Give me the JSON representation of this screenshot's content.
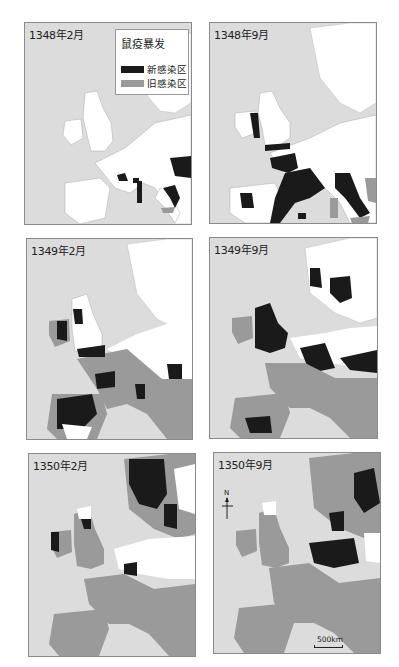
{
  "figure": {
    "type": "plague-spread-map-series",
    "panels": [
      {
        "id": "p1",
        "title": "1348年2月",
        "box": [
          24,
          22,
          166,
          201
        ]
      },
      {
        "id": "p2",
        "title": "1348年9月",
        "box": [
          209,
          22,
          166,
          200
        ]
      },
      {
        "id": "p3",
        "title": "1349年2月",
        "box": [
          26,
          238,
          165,
          200
        ]
      },
      {
        "id": "p4",
        "title": "1349年9月",
        "box": [
          209,
          237,
          167,
          200
        ]
      },
      {
        "id": "p5",
        "title": "1350年2月",
        "box": [
          28,
          453,
          166,
          202
        ]
      },
      {
        "id": "p6",
        "title": "1350年9月",
        "box": [
          213,
          452,
          166,
          200
        ]
      }
    ],
    "legend": {
      "title": "鼠疫暴发",
      "items": [
        {
          "label": "新感染区",
          "color": "#1a1a1a"
        },
        {
          "label": "旧感染区",
          "color": "#9a9a9a"
        }
      ]
    },
    "compass": {
      "label": "N"
    },
    "scale": {
      "label": "500km"
    },
    "colors": {
      "sea": "#dcdcdc",
      "land_uninfected": "#ffffff",
      "new_infection": "#1a1a1a",
      "old_infection": "#8f8f8f",
      "border": "#8a8a8a"
    }
  }
}
